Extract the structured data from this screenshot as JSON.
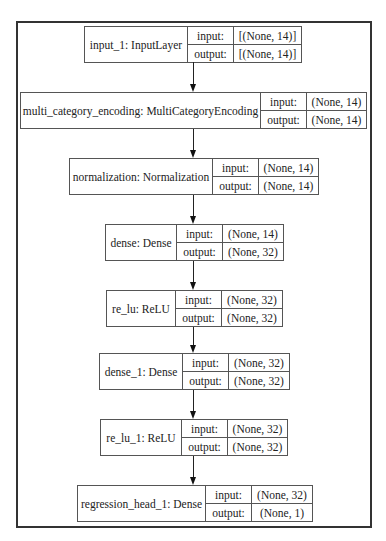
{
  "diagram": {
    "type": "keras_model_plot",
    "field_labels": {
      "input": "input:",
      "output": "output:"
    },
    "layers": [
      {
        "name": "input_1: InputLayer",
        "input": "[(None, 14)]",
        "output": "[(None, 14)]"
      },
      {
        "name": "multi_category_encoding: MultiCategoryEncoding",
        "input": "(None, 14)",
        "output": "(None, 14)"
      },
      {
        "name": "normalization: Normalization",
        "input": "(None, 14)",
        "output": "(None, 14)"
      },
      {
        "name": "dense: Dense",
        "input": "(None, 14)",
        "output": "(None, 32)"
      },
      {
        "name": "re_lu: ReLU",
        "input": "(None, 32)",
        "output": "(None, 32)"
      },
      {
        "name": "dense_1: Dense",
        "input": "(None, 32)",
        "output": "(None, 32)"
      },
      {
        "name": "re_lu_1: ReLU",
        "input": "(None, 32)",
        "output": "(None, 32)"
      },
      {
        "name": "regression_head_1: Dense",
        "input": "(None, 32)",
        "output": "(None, 1)"
      }
    ],
    "edges": [
      {
        "from": 0,
        "to": 1
      },
      {
        "from": 1,
        "to": 2
      },
      {
        "from": 2,
        "to": 3
      },
      {
        "from": 3,
        "to": 4
      },
      {
        "from": 4,
        "to": 5
      },
      {
        "from": 5,
        "to": 6
      },
      {
        "from": 6,
        "to": 7
      }
    ],
    "colors": {
      "border": "#555555",
      "frame": "#333333",
      "arrow": "#111111",
      "text": "#222222",
      "background": "#ffffff"
    }
  }
}
